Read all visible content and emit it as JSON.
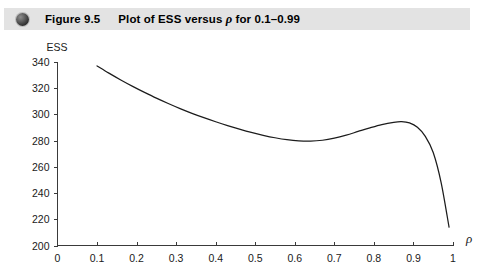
{
  "caption": {
    "bullet_icon": "sphere-bullet-icon",
    "figure_number": "Figure 9.5",
    "figure_title_pre": "Plot of ESS versus ",
    "figure_title_rho": "ρ",
    "figure_title_post": " for 0.1–0.99",
    "band_color": "#e3e3e3"
  },
  "chart_data": {
    "type": "line",
    "title": "Plot of ESS versus ρ for 0.1–0.99",
    "xlabel": "ρ",
    "ylabel": "ESS",
    "xlim": [
      0,
      1
    ],
    "ylim": [
      200,
      340
    ],
    "grid": false,
    "legend": "none",
    "line_color": "#1c1c1c",
    "xticks": [
      0,
      0.1,
      0.2,
      0.3,
      0.4,
      0.5,
      0.6,
      0.7,
      0.8,
      0.9,
      1
    ],
    "xticklabels": [
      "0",
      "0.1",
      "0.2",
      "0.3",
      "0.4",
      "0.5",
      "0.6",
      "0.7",
      "0.8",
      "0.9",
      "1"
    ],
    "yticks": [
      200,
      220,
      240,
      260,
      280,
      300,
      320,
      340
    ],
    "yticklabels": [
      "200",
      "220",
      "240",
      "260",
      "280",
      "300",
      "320",
      "340"
    ],
    "series": [
      {
        "name": "ESS",
        "x": [
          0.1,
          0.13,
          0.16,
          0.19,
          0.22,
          0.25,
          0.28,
          0.31,
          0.34,
          0.37,
          0.4,
          0.43,
          0.46,
          0.49,
          0.52,
          0.55,
          0.58,
          0.61,
          0.64,
          0.67,
          0.7,
          0.73,
          0.76,
          0.79,
          0.82,
          0.85,
          0.87,
          0.89,
          0.91,
          0.93,
          0.95,
          0.97,
          0.99
        ],
        "y": [
          337.0,
          331.5,
          326.3,
          321.4,
          316.8,
          312.4,
          308.3,
          304.4,
          300.8,
          297.5,
          294.4,
          291.5,
          288.8,
          286.3,
          284.1,
          282.2,
          280.7,
          279.8,
          279.6,
          280.3,
          281.9,
          284.2,
          287.0,
          289.8,
          292.3,
          294.0,
          294.5,
          293.5,
          290.2,
          283.3,
          271.0,
          248.0,
          214.0
        ]
      }
    ],
    "annotations": {
      "local_minimum": {
        "x": 0.64,
        "y": 279.6
      },
      "local_maximum": {
        "x": 0.87,
        "y": 294.5
      },
      "start_point": {
        "x": 0.1,
        "y": 337.0
      },
      "end_point": {
        "x": 0.99,
        "y": 214.0
      }
    }
  }
}
